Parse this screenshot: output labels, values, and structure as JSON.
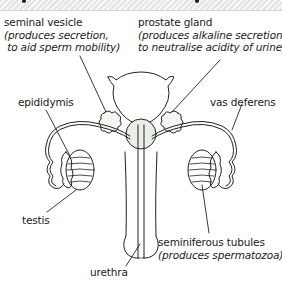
{
  "header": {
    "title_cropped": true
  },
  "labels": {
    "seminal_vesicle": {
      "name": "seminal vesicle",
      "desc1": "(produces secretion,",
      "desc2": " to aid sperm mobility)"
    },
    "prostate_gland": {
      "name": "prostate gland",
      "desc1": "(produces alkaline secretion",
      "desc2": "to neutralise acidity of urine)"
    },
    "epididymis": {
      "name": "epididymis"
    },
    "vas_deferens": {
      "name": "vas deferens"
    },
    "testis": {
      "name": "testis"
    },
    "seminiferous_tubules": {
      "name": "seminiferous tubules",
      "desc": "(produces spermatozoa)"
    },
    "urethra": {
      "name": "urethra"
    }
  },
  "colors": {
    "line": "#222222",
    "gland_fill": "#e9eee6",
    "header_hatch": "#e4e4e4"
  }
}
